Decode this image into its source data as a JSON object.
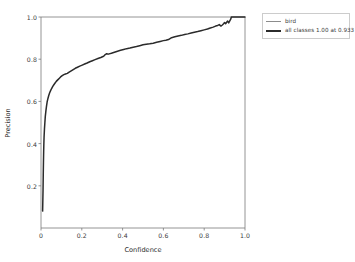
{
  "chart_data": {
    "type": "line",
    "title": "",
    "xlabel": "Confidence",
    "ylabel": "Precision",
    "xlim": [
      0.0,
      1.0
    ],
    "ylim": [
      0.0,
      1.0
    ],
    "grid": false,
    "legend_position": "upper right outside",
    "xticks": [
      "0",
      "0.2",
      "0.4",
      "0.6",
      "0.8",
      "1.0"
    ],
    "xtick_values": [
      0.0,
      0.2,
      0.4,
      0.6,
      0.8,
      1.0
    ],
    "yticks": [
      "0.2",
      "0.4",
      "0.6",
      "0.8",
      "1.0"
    ],
    "ytick_values": [
      0.2,
      0.4,
      0.6,
      0.8,
      1.0
    ],
    "legend": [
      {
        "label": "bird",
        "color": "#8c8c8c",
        "width": "thin"
      },
      {
        "label": "all classes 1.00 at 0.933",
        "color": "#2b2b2b",
        "width": "thick"
      }
    ],
    "series": [
      {
        "name": "all classes 1.00 at 0.933",
        "color": "#2b2b2b",
        "x": [
          0.008,
          0.01,
          0.011,
          0.012,
          0.013,
          0.014,
          0.015,
          0.017,
          0.019,
          0.021,
          0.024,
          0.027,
          0.03,
          0.034,
          0.038,
          0.042,
          0.047,
          0.052,
          0.057,
          0.063,
          0.069,
          0.075,
          0.082,
          0.089,
          0.096,
          0.104,
          0.112,
          0.12,
          0.129,
          0.138,
          0.148,
          0.158,
          0.168,
          0.179,
          0.19,
          0.202,
          0.214,
          0.226,
          0.239,
          0.252,
          0.265,
          0.279,
          0.293,
          0.307,
          0.315,
          0.322,
          0.33,
          0.345,
          0.36,
          0.375,
          0.39,
          0.405,
          0.42,
          0.436,
          0.452,
          0.468,
          0.484,
          0.5,
          0.516,
          0.533,
          0.55,
          0.567,
          0.584,
          0.6,
          0.612,
          0.625,
          0.64,
          0.656,
          0.672,
          0.688,
          0.704,
          0.72,
          0.736,
          0.752,
          0.768,
          0.784,
          0.8,
          0.816,
          0.83,
          0.844,
          0.856,
          0.866,
          0.874,
          0.882,
          0.889,
          0.895,
          0.9,
          0.905,
          0.91,
          0.915,
          0.92,
          0.924,
          0.928,
          0.931,
          0.933,
          0.96,
          1.0
        ],
        "y": [
          0.08,
          0.18,
          0.25,
          0.31,
          0.36,
          0.4,
          0.43,
          0.47,
          0.5,
          0.528,
          0.555,
          0.578,
          0.597,
          0.614,
          0.628,
          0.64,
          0.651,
          0.661,
          0.67,
          0.679,
          0.687,
          0.695,
          0.702,
          0.709,
          0.716,
          0.722,
          0.727,
          0.73,
          0.733,
          0.739,
          0.745,
          0.751,
          0.757,
          0.762,
          0.767,
          0.772,
          0.777,
          0.782,
          0.788,
          0.793,
          0.798,
          0.803,
          0.808,
          0.814,
          0.822,
          0.826,
          0.824,
          0.828,
          0.833,
          0.838,
          0.842,
          0.846,
          0.85,
          0.853,
          0.857,
          0.86,
          0.864,
          0.868,
          0.871,
          0.873,
          0.876,
          0.88,
          0.884,
          0.888,
          0.89,
          0.893,
          0.902,
          0.906,
          0.91,
          0.913,
          0.917,
          0.92,
          0.924,
          0.928,
          0.931,
          0.935,
          0.939,
          0.943,
          0.948,
          0.952,
          0.957,
          0.96,
          0.964,
          0.957,
          0.962,
          0.968,
          0.974,
          0.968,
          0.975,
          0.981,
          0.972,
          0.979,
          0.986,
          0.992,
          1.0,
          1.0,
          1.0
        ]
      }
    ]
  },
  "axes": {
    "plot_left": 41,
    "plot_right": 245,
    "plot_top": 17,
    "plot_bottom": 228,
    "spine_color": "#7a7a7a"
  }
}
